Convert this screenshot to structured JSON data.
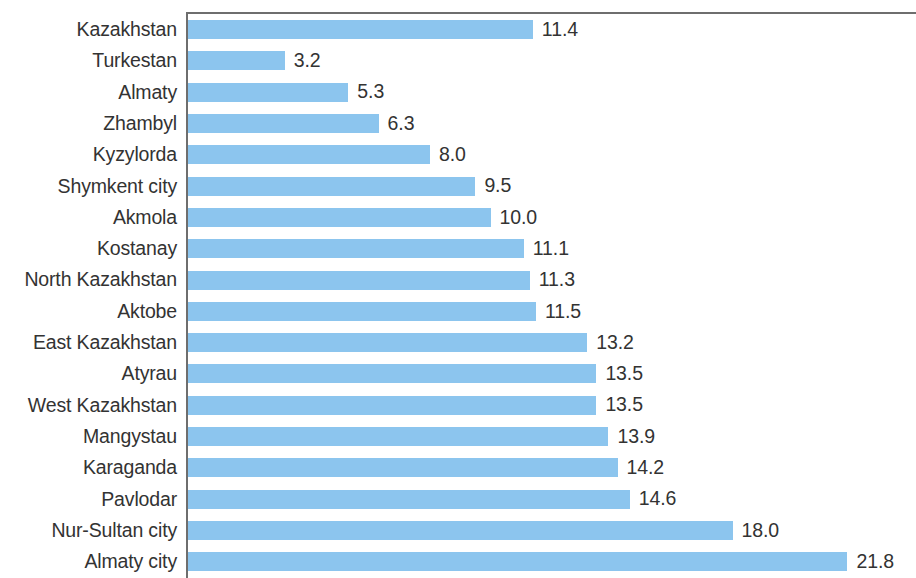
{
  "chart_data": {
    "type": "bar",
    "orientation": "horizontal",
    "title": "",
    "subtitle": "",
    "xlabel": "",
    "ylabel": "",
    "xlim": [
      0,
      24.1
    ],
    "grid": false,
    "legend": null,
    "bar_color": "#8CC5EE",
    "label_color": "#333333",
    "axis_color": "#6E6E6E",
    "value_label_format": "one-decimal",
    "categories": [
      "Kazakhstan",
      "Turkestan",
      "Almaty",
      "Zhambyl",
      "Kyzylorda",
      "Shymkent city",
      "Akmola",
      "Kostanay",
      "North Kazakhstan",
      "Aktobe",
      "East Kazakhstan",
      "Atyrau",
      "West Kazakhstan",
      "Mangystau",
      "Karaganda",
      "Pavlodar",
      "Nur-Sultan city",
      "Almaty city"
    ],
    "values": [
      11.4,
      3.2,
      5.3,
      6.3,
      8.0,
      9.5,
      10.0,
      11.1,
      11.3,
      11.5,
      13.2,
      13.5,
      13.5,
      13.9,
      14.2,
      14.6,
      18.0,
      21.8
    ],
    "value_labels": [
      "11.4",
      "3.2",
      "5.3",
      "6.3",
      "8.0",
      "9.5",
      "10.0",
      "11.1",
      "11.3",
      "11.5",
      "13.2",
      "13.5",
      "13.5",
      "13.9",
      "14.2",
      "14.6",
      "18.0",
      "21.8"
    ]
  },
  "layout": {
    "axis_x_px": 186,
    "plot_top_px": 12,
    "row_pitch_px": 31.3,
    "bar_height_px": 19,
    "px_per_unit": 30.25
  }
}
